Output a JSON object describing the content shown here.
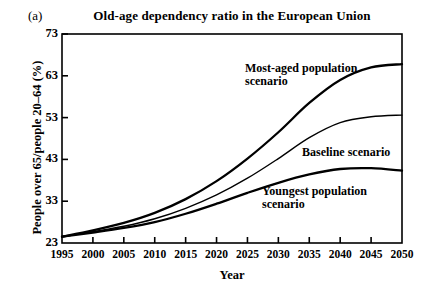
{
  "panel": {
    "label": "(a)"
  },
  "chart_data": {
    "type": "line",
    "title": "Old-age dependency ratio in the European Union",
    "xlabel": "Year",
    "ylabel": "People over 65/people 20–64 (%)",
    "xlim": [
      1995,
      2050
    ],
    "ylim": [
      23,
      73
    ],
    "xticks": [
      1995,
      2000,
      2005,
      2010,
      2015,
      2020,
      2025,
      2030,
      2035,
      2040,
      2045,
      2050
    ],
    "yticks": [
      23,
      33,
      43,
      53,
      63,
      73
    ],
    "grid": false,
    "legend": "inline-annotations",
    "x": [
      1995,
      2000,
      2005,
      2010,
      2015,
      2020,
      2025,
      2030,
      2035,
      2040,
      2045,
      2050
    ],
    "series": [
      {
        "name": "Most-aged population scenario",
        "color": "#000000",
        "values": [
          24.5,
          26.0,
          27.8,
          30.2,
          33.5,
          37.8,
          43.2,
          49.5,
          56.5,
          62.0,
          65.0,
          65.8
        ]
      },
      {
        "name": "Baseline scenario",
        "color": "#000000",
        "values": [
          24.5,
          25.7,
          27.0,
          28.8,
          31.3,
          34.5,
          38.5,
          43.2,
          48.2,
          51.8,
          53.2,
          53.6
        ]
      },
      {
        "name": "Youngest population scenario",
        "color": "#000000",
        "values": [
          24.5,
          25.5,
          26.6,
          28.0,
          30.0,
          32.4,
          35.0,
          37.4,
          39.4,
          40.7,
          40.9,
          40.3
        ]
      }
    ],
    "annotations": [
      {
        "text": "Most-aged population\nscenario",
        "x_px": 245,
        "y_px": 62
      },
      {
        "text": "Baseline scenario",
        "x_px": 302,
        "y_px": 146
      },
      {
        "text": "Youngest population\nscenario",
        "x_px": 262,
        "y_px": 185
      }
    ]
  }
}
